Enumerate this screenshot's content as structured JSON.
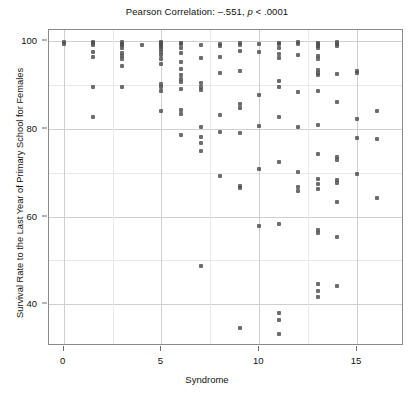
{
  "chart_data": {
    "type": "scatter",
    "title": "Pearson Correlation: –.551, p < .0001",
    "title_parts": {
      "prefix": "Pearson Correlation: –.551,",
      "italic": "p",
      "suffix": "< .0001"
    },
    "xlabel": "Syndrome",
    "ylabel": "Survival Rate to the Last Year of Primary School for Females",
    "xlim": [
      -0.75,
      17.4
    ],
    "ylim": [
      30.5,
      102.5
    ],
    "xticks": [
      0,
      5,
      10,
      15
    ],
    "yticks": [
      40,
      60,
      80,
      100
    ],
    "xtick_labels": [
      "0",
      "5",
      "10",
      "15"
    ],
    "ytick_labels": [
      "40",
      "60",
      "80",
      "100"
    ],
    "x_minor_gridlines": [
      2.5,
      7.5,
      12.5
    ],
    "y_minor_gridlines": [
      50,
      70,
      90
    ],
    "grid": true,
    "legend": "none",
    "marker_color": "#4d4d4d",
    "frame_color": "#8a8a8a",
    "grid_color": "#e8e8e8",
    "correlation": -0.551,
    "p_value": "< .0001",
    "points": [
      [
        0,
        99.7
      ],
      [
        0,
        99.4
      ],
      [
        1.5,
        99.8
      ],
      [
        1.5,
        99.5
      ],
      [
        1.5,
        99.0
      ],
      [
        1.5,
        97.6
      ],
      [
        1.5,
        96.3
      ],
      [
        1.5,
        89.6
      ],
      [
        1.5,
        82.7
      ],
      [
        3,
        99.8
      ],
      [
        3,
        99.4
      ],
      [
        3,
        99.0
      ],
      [
        3,
        98.3
      ],
      [
        3,
        97.3
      ],
      [
        3,
        96.6
      ],
      [
        3,
        95.8
      ],
      [
        3,
        94.4
      ],
      [
        3,
        89.6
      ],
      [
        4,
        99.0
      ],
      [
        5,
        99.8
      ],
      [
        5,
        99.6
      ],
      [
        5,
        99.3
      ],
      [
        5,
        99.0
      ],
      [
        5,
        98.6
      ],
      [
        5,
        98.1
      ],
      [
        5,
        97.6
      ],
      [
        5,
        96.8
      ],
      [
        5,
        95.9
      ],
      [
        5,
        94.8
      ],
      [
        5,
        90.2
      ],
      [
        5,
        89.4
      ],
      [
        5,
        88.6
      ],
      [
        5,
        84.0
      ],
      [
        6,
        99.6
      ],
      [
        6,
        99.2
      ],
      [
        6,
        98.4
      ],
      [
        6,
        97.2
      ],
      [
        6,
        95.2
      ],
      [
        6,
        93.6
      ],
      [
        6,
        92.2
      ],
      [
        6,
        91.4
      ],
      [
        6,
        90.6
      ],
      [
        6,
        89.0
      ],
      [
        6,
        84.2
      ],
      [
        6,
        83.4
      ],
      [
        6,
        78.6
      ],
      [
        7,
        99.0
      ],
      [
        7,
        96.2
      ],
      [
        7,
        90.4
      ],
      [
        7,
        89.6
      ],
      [
        7,
        88.8
      ],
      [
        7,
        80.4
      ],
      [
        7,
        78.2
      ],
      [
        7,
        76.8
      ],
      [
        7,
        75.0
      ],
      [
        7,
        48.8
      ],
      [
        8,
        99.4
      ],
      [
        8,
        98.8
      ],
      [
        8,
        96.4
      ],
      [
        8,
        92.8
      ],
      [
        8,
        83.2
      ],
      [
        8,
        79.2
      ],
      [
        8,
        69.2
      ],
      [
        9,
        99.6
      ],
      [
        9,
        99.1
      ],
      [
        9,
        97.8
      ],
      [
        9,
        93.2
      ],
      [
        9,
        85.6
      ],
      [
        9,
        84.8
      ],
      [
        9,
        79.0
      ],
      [
        9,
        67.0
      ],
      [
        9,
        66.4
      ],
      [
        9,
        34.6
      ],
      [
        10,
        99.4
      ],
      [
        10,
        97.4
      ],
      [
        10,
        87.8
      ],
      [
        10,
        80.6
      ],
      [
        10,
        70.8
      ],
      [
        10,
        57.8
      ],
      [
        11,
        99.6
      ],
      [
        11,
        99.2
      ],
      [
        11,
        98.4
      ],
      [
        11,
        97.0
      ],
      [
        11,
        96.2
      ],
      [
        11,
        90.8
      ],
      [
        11,
        89.6
      ],
      [
        11,
        82.6
      ],
      [
        11,
        72.4
      ],
      [
        11,
        58.2
      ],
      [
        11,
        38.0
      ],
      [
        11,
        36.4
      ],
      [
        11,
        33.2
      ],
      [
        12,
        99.8
      ],
      [
        12,
        99.2
      ],
      [
        12,
        96.8
      ],
      [
        12,
        88.4
      ],
      [
        12,
        80.4
      ],
      [
        12,
        70.2
      ],
      [
        12,
        66.8
      ],
      [
        12,
        65.8
      ],
      [
        13,
        99.6
      ],
      [
        13,
        99.3
      ],
      [
        13,
        98.9
      ],
      [
        13,
        98.5
      ],
      [
        13,
        96.6
      ],
      [
        13,
        95.8
      ],
      [
        13,
        93.4
      ],
      [
        13,
        92.8
      ],
      [
        13,
        92.2
      ],
      [
        13,
        88.6
      ],
      [
        13,
        80.8
      ],
      [
        13,
        74.2
      ],
      [
        13,
        68.6
      ],
      [
        13,
        67.4
      ],
      [
        13,
        66.2
      ],
      [
        13,
        57.0
      ],
      [
        13,
        56.2
      ],
      [
        13,
        44.6
      ],
      [
        13,
        43.0
      ],
      [
        13,
        41.6
      ],
      [
        14,
        99.7
      ],
      [
        14,
        99.3
      ],
      [
        14,
        98.8
      ],
      [
        14,
        92.4
      ],
      [
        14,
        86.0
      ],
      [
        14,
        73.6
      ],
      [
        14,
        72.8
      ],
      [
        14,
        68.4
      ],
      [
        14,
        67.6
      ],
      [
        14,
        63.4
      ],
      [
        14,
        55.4
      ],
      [
        14,
        44.2
      ],
      [
        15,
        93.2
      ],
      [
        15,
        92.6
      ],
      [
        15,
        82.2
      ],
      [
        15,
        77.8
      ],
      [
        15,
        69.6
      ],
      [
        16,
        84.0
      ],
      [
        16,
        77.6
      ],
      [
        16,
        64.2
      ]
    ]
  }
}
